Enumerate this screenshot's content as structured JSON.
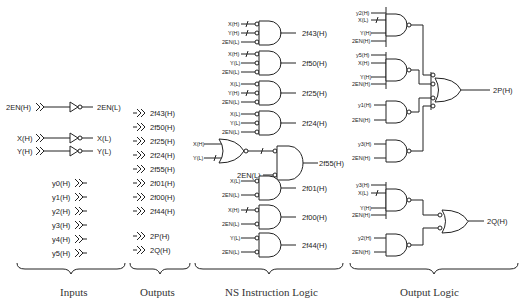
{
  "sections": {
    "inputs": "Inputs",
    "outputs": "Outputs",
    "ns_logic": "NS Instruction Logic",
    "output_logic": "Output Logic"
  },
  "inputs": {
    "en_in": "2EN(H)",
    "en_out": "2EN(L)",
    "x_in": "X(H)",
    "x_out": "X(L)",
    "y_in": "Y(H)",
    "y_out": "Y(L)",
    "y_signals": [
      "y0(H)",
      "y1(H)",
      "y2(H)",
      "y3(H)",
      "y4(H)",
      "y5(H)"
    ]
  },
  "outputs": [
    "2f43(H)",
    "2f50(H)",
    "2f25(H)",
    "2f24(H)",
    "2f55(H)",
    "2f01(H)",
    "2f00(H)",
    "2f44(H)",
    "2P(H)",
    "2Q(H)"
  ],
  "ns_logic": {
    "gates": [
      {
        "inputs": [
          "X(H)",
          "Y(H)",
          "2EN(L)"
        ],
        "output": "2f43(H)"
      },
      {
        "inputs": [
          "X(H)",
          "Y(L)",
          "2EN(L)"
        ],
        "output": "2f50(H)"
      },
      {
        "inputs": [
          "X(L)",
          "Y(H)",
          "2EN(L)"
        ],
        "output": "2f25(H)"
      },
      {
        "inputs": [
          "X(L)",
          "Y(L)",
          "2EN(L)"
        ],
        "output": "2f24(H)"
      },
      {
        "inputs": [
          "X(H)",
          "Y(L)",
          "2EN(L)"
        ],
        "output": "2f55(H)"
      },
      {
        "inputs": [
          "X(L)",
          "2EN(L)"
        ],
        "output": "2f01(H)"
      },
      {
        "inputs": [
          "X(H)",
          "2EN(L)"
        ],
        "output": "2f00(H)"
      },
      {
        "inputs": [
          "Y(L)",
          "2EN(L)"
        ],
        "output": "2f44(H)"
      }
    ]
  },
  "output_logic": {
    "p_gates": [
      {
        "inputs": [
          "y2(H)",
          "X(L)",
          "Y(H)",
          "2EN(H)"
        ]
      },
      {
        "inputs": [
          "y5(H)",
          "X(H)",
          "Y(H)",
          "2EN(H)"
        ]
      },
      {
        "inputs": [
          "y1(H)",
          "2EN(H)"
        ]
      },
      {
        "inputs": [
          "y3(H)",
          "2EN(H)"
        ]
      }
    ],
    "p_output": "2P(H)",
    "q_gates": [
      {
        "inputs": [
          "y3(H)",
          "X(L)",
          "Y(H)",
          "2EN(H)"
        ]
      },
      {
        "inputs": [
          "y2(H)",
          "2EN(H)"
        ]
      }
    ],
    "q_output": "2Q(H)"
  }
}
